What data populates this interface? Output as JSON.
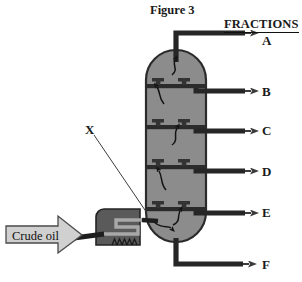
{
  "figure": {
    "title": "Figure 3",
    "type": "fractional-distillation-column-diagram"
  },
  "header": {
    "fractions_label": "FRACTIONS"
  },
  "labels": {
    "pointer_x": "X",
    "crude_oil": "Crude oil"
  },
  "fractions": [
    {
      "id": "A",
      "label": "A",
      "y": 36
    },
    {
      "id": "B",
      "label": "B",
      "y": 87
    },
    {
      "id": "C",
      "label": "C",
      "y": 124
    },
    {
      "id": "D",
      "label": "D",
      "y": 166
    },
    {
      "id": "E",
      "label": "E",
      "y": 206
    },
    {
      "id": "F",
      "label": "F",
      "y": 258
    }
  ],
  "colors": {
    "column_fill": "#8c8c8c",
    "outline": "#2b2b2b",
    "pipe_dark": "#262626",
    "furnace_box": "#5a5a5a",
    "arrow_light": "#d0d0d0",
    "text": "#111111",
    "background": "#ffffff"
  },
  "parts": {
    "column": "distillation-column",
    "trays": 5,
    "bubble_caps_per_tray": 2,
    "furnace": "furnace-with-coil",
    "burner": "burner-flames",
    "inlet": "crude-oil-inlet-arrow"
  }
}
